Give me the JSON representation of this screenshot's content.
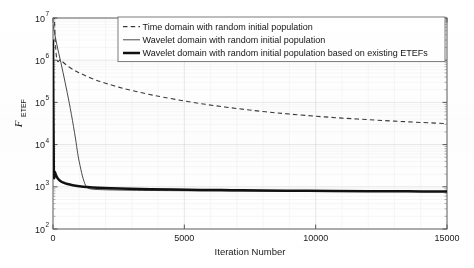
{
  "chart_data": {
    "type": "line",
    "title": "",
    "xlabel": "Iteration Number",
    "ylabel": "F_ETEF",
    "ylabel_main": "F",
    "ylabel_sub": "ETEF",
    "xlim": [
      0,
      15000
    ],
    "ylim": [
      100,
      10000000
    ],
    "yscale": "log",
    "xscale": "linear",
    "grid": true,
    "legend_position": "top-center",
    "xticks": [
      0,
      5000,
      10000,
      15000
    ],
    "xticklabels": [
      "0",
      "5000",
      "10000",
      "15000"
    ],
    "yticks": [
      100,
      1000,
      10000,
      100000,
      1000000,
      10000000
    ],
    "yticklabels": [
      "10^2",
      "10^3",
      "10^4",
      "10^5",
      "10^6",
      "10^7"
    ],
    "ytick_mantissa": "10",
    "ytick_exponents": [
      "2",
      "3",
      "4",
      "5",
      "6",
      "7"
    ],
    "series": [
      {
        "name": "Time domain with random initial population",
        "style": "dashed",
        "color": "#3a3a3a",
        "x": [
          0,
          120,
          300,
          600,
          900,
          1200,
          1600,
          2000,
          2500,
          3000,
          3600,
          4200,
          5000,
          5800,
          6600,
          7400,
          8200,
          9000,
          10000,
          11000,
          12000,
          13000,
          14000,
          15000
        ],
        "y": [
          100000000,
          1400000,
          1000000,
          700000,
          540000,
          440000,
          345000,
          285000,
          230000,
          192000,
          158000,
          133000,
          108000,
          90000,
          77000,
          67000,
          59000,
          53000,
          47000,
          42500,
          39000,
          36000,
          33500,
          31500
        ]
      },
      {
        "name": "Wavelet domain with random initial population",
        "style": "solid-thin",
        "color": "#4a4a4a",
        "x": [
          0,
          40,
          90,
          150,
          220,
          300,
          380,
          460,
          540,
          620,
          700,
          780,
          860,
          940,
          1000,
          1060,
          1120,
          1180,
          1240,
          1300,
          1400,
          1600,
          2000,
          2600,
          3400,
          4400,
          5600,
          7000,
          9000,
          11000,
          13000,
          15000
        ],
        "y": [
          7000000,
          5200000,
          3500000,
          2300000,
          1450000,
          880000,
          520000,
          300000,
          172000,
          96000,
          52000,
          27000,
          13500,
          6200,
          3900,
          2600,
          1800,
          1350,
          1080,
          960,
          900,
          870,
          850,
          835,
          822,
          812,
          803,
          795,
          785,
          778,
          772,
          765
        ]
      },
      {
        "name": "Wavelet domain with random initial population based on existing ETEFs",
        "style": "solid-thick",
        "color": "#111111",
        "x": [
          0,
          30,
          70,
          120,
          190,
          280,
          400,
          550,
          750,
          1000,
          1300,
          1700,
          2200,
          2900,
          3700,
          4600,
          5600,
          6800,
          8000,
          9300,
          10600,
          12000,
          13500,
          15000
        ],
        "y": [
          3100000,
          2900,
          2250,
          1850,
          1560,
          1380,
          1250,
          1160,
          1090,
          1035,
          990,
          950,
          920,
          895,
          875,
          858,
          843,
          830,
          818,
          808,
          798,
          789,
          780,
          772
        ]
      }
    ]
  },
  "legend": {
    "entries": [
      {
        "label": "Time domain with random initial population",
        "style": "dashed"
      },
      {
        "label": "Wavelet domain with random initial population",
        "style": "solid-thin"
      },
      {
        "label": "Wavelet domain with random initial population based on existing ETEFs",
        "style": "solid-thick"
      }
    ]
  },
  "axis": {
    "x_title": "Iteration Number",
    "y_title_main": "F",
    "y_title_sub": "ETEF"
  },
  "colors": {
    "background": "#ffffff",
    "axis": "#5a5a5a",
    "grid_major": "#d9d9d9",
    "grid_minor": "#ececec",
    "series_dashed": "#3a3a3a",
    "series_thin": "#4a4a4a",
    "series_thick": "#111111",
    "text": "#141414"
  }
}
